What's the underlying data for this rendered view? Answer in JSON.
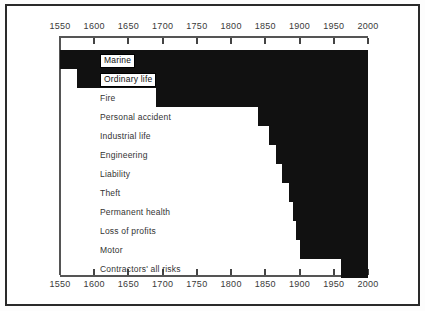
{
  "chart_data": {
    "type": "bar",
    "orientation": "horizontal",
    "title": "",
    "subtitle": "",
    "xlabel": "",
    "ylabel": "",
    "xlim": [
      1550,
      2000
    ],
    "grid": false,
    "legend": false,
    "axis_positions": [
      "top",
      "bottom"
    ],
    "bar_color": "#111111",
    "tick_labels": [
      "1550",
      "1600",
      "1650",
      "1700",
      "1750",
      "1800",
      "1850",
      "1900",
      "1950",
      "2000"
    ],
    "tick_values": [
      1550,
      1600,
      1650,
      1700,
      1750,
      1800,
      1850,
      1900,
      1950,
      2000
    ],
    "categories": [
      "Marine",
      "Ordinary life",
      "Fire",
      "Personal accident",
      "Industrial life",
      "Engineering",
      "Liability",
      "Theft",
      "Permanent health",
      "Loss of profits",
      "Motor",
      "Contractors' all risks"
    ],
    "series": [
      {
        "name": "Period of operation",
        "start_values": [
          1550,
          1575,
          1690,
          1840,
          1855,
          1865,
          1875,
          1885,
          1890,
          1895,
          1900,
          1960
        ],
        "end_values": [
          2000,
          2000,
          2000,
          2000,
          2000,
          2000,
          2000,
          2000,
          2000,
          2000,
          2000,
          2000
        ]
      }
    ],
    "label_styles": [
      "boxed",
      "boxed",
      "plain",
      "plain",
      "plain",
      "plain",
      "plain",
      "plain",
      "plain",
      "plain",
      "plain",
      "plain"
    ]
  }
}
